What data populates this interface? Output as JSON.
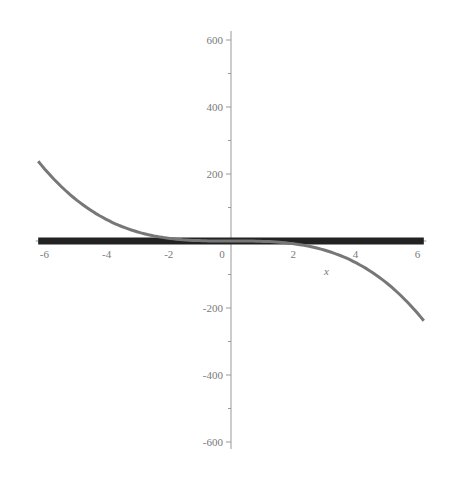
{
  "chart_data": {
    "type": "line",
    "title": "",
    "xlabel": "x",
    "ylabel": "",
    "xlim": [
      -6.28,
      6.28
    ],
    "ylim": [
      -630,
      630
    ],
    "grid": false,
    "legend": null,
    "x_ticks": [
      -6,
      -4,
      -2,
      0,
      2,
      4,
      6
    ],
    "x_tick_labels": [
      "-6",
      "-4",
      "-2",
      "0",
      "2",
      "4",
      "6"
    ],
    "y_ticks": [
      600,
      400,
      200,
      -200,
      -400,
      -600
    ],
    "y_tick_labels": [
      "600",
      "400",
      "200",
      "-200",
      "-400",
      "-600"
    ],
    "series": [
      {
        "name": "f1",
        "description": "cubic curve, approx y = -x^3",
        "color": "#777777",
        "width": 3,
        "x": [
          -6.2,
          -5,
          -4,
          -3,
          -2,
          -1,
          0,
          1,
          2,
          3,
          4,
          5,
          6.2
        ],
        "y": [
          238,
          125,
          64,
          27,
          8,
          1,
          0,
          -1,
          -8,
          -27,
          -64,
          -125,
          -238
        ]
      },
      {
        "name": "f2",
        "description": "thick horizontal line at y = 0",
        "color": "#222222",
        "width": 7,
        "x": [
          -6.2,
          6.2
        ],
        "y": [
          0,
          0
        ]
      }
    ]
  }
}
